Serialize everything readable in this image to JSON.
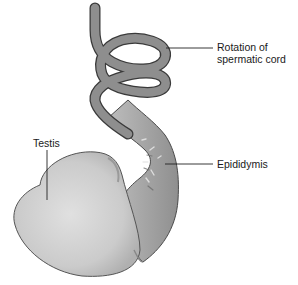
{
  "figure": {
    "labels": {
      "cord": {
        "line1": "Rotation of",
        "line2": "spermatic cord"
      },
      "epididymis": "Epididymis",
      "testis": "Testis"
    },
    "colors": {
      "cord_fill": "#8e8e8e",
      "cord_outline": "#3a3a3a",
      "testis_fill": "#cfcfcf",
      "epididymis_fill": "#a9a9a9",
      "leader_line": "#222222"
    }
  }
}
